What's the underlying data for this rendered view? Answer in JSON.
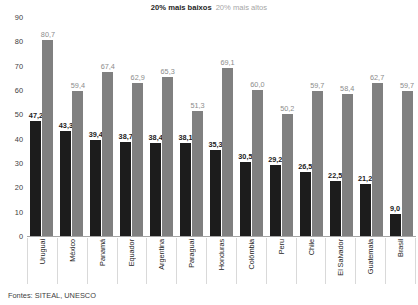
{
  "chart_data": {
    "type": "bar",
    "title": "",
    "subtitle": "",
    "xlabel": "",
    "ylabel": "",
    "ylim": [
      0,
      90
    ],
    "ytick_step": 10,
    "yticks": [
      "90",
      "80",
      "70",
      "60",
      "50",
      "40",
      "30",
      "20",
      "10",
      "0"
    ],
    "grid": false,
    "legend_position": "top-center",
    "decimal_separator": ",",
    "categories": [
      "Uruguai",
      "México",
      "Panamá",
      "Equador",
      "Argentina",
      "Paraguai",
      "Honduras",
      "Colômbia",
      "Peru",
      "Chile",
      "El Salvador",
      "Guatemala",
      "Brasil"
    ],
    "series": [
      {
        "name": "20% mais baixos",
        "color": "#1c1c1c",
        "values": [
          47.2,
          43.3,
          39.4,
          38.7,
          38.4,
          38.1,
          35.3,
          30.5,
          29.2,
          26.5,
          22.5,
          21.2,
          9.0
        ],
        "labels": [
          "47,2",
          "43,3",
          "39,4",
          "38,7",
          "38,4",
          "38,1",
          "35,3",
          "30,5",
          "29,2",
          "26,5",
          "22,5",
          "21,2",
          "9,0"
        ]
      },
      {
        "name": "20% mais altos",
        "color": "#808080",
        "values": [
          80.7,
          59.4,
          67.4,
          62.9,
          65.3,
          51.3,
          69.1,
          60.0,
          50.2,
          59.7,
          58.4,
          62.7,
          59.7
        ],
        "labels": [
          "80,7",
          "59,4",
          "67,4",
          "62,9",
          "65,3",
          "51,3",
          "69,1",
          "60,0",
          "50,2",
          "59,7",
          "58,4",
          "62,7",
          "59,7"
        ]
      }
    ]
  },
  "legend": {
    "low_label": "20% mais baixos",
    "high_label": "20% mais altos"
  },
  "footer": {
    "source": "Fontes: SITEAL, UNESCO"
  },
  "colors": {
    "low": "#1c1c1c",
    "high": "#808080",
    "axis": "#a6a6a6",
    "text": "#262626"
  }
}
